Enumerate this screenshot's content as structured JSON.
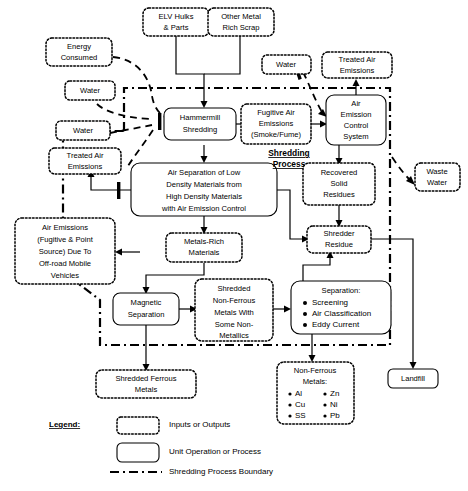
{
  "figure": {
    "boxes": [
      {
        "id": "elv_hulks",
        "kind": "input-output",
        "lines": [
          "ELV Hulks",
          "& Parts"
        ]
      },
      {
        "id": "other_metal_scrap",
        "kind": "input-output",
        "lines": [
          "Other Metal",
          "Rich Scrap"
        ]
      },
      {
        "id": "energy_consumed",
        "kind": "input-output",
        "lines": [
          "Energy",
          "Consumed"
        ]
      },
      {
        "id": "water_top",
        "kind": "input-output",
        "lines": [
          "Water"
        ]
      },
      {
        "id": "water_left",
        "kind": "input-output",
        "lines": [
          "Water"
        ]
      },
      {
        "id": "water_right",
        "kind": "input-output",
        "lines": [
          "Water"
        ]
      },
      {
        "id": "treated_air_emissions_left",
        "kind": "input-output",
        "lines": [
          "Treated Air",
          "Emissions"
        ]
      },
      {
        "id": "treated_air_emissions_right",
        "kind": "input-output",
        "lines": [
          "Treated Air",
          "Emissions"
        ]
      },
      {
        "id": "hammermill_shredding",
        "kind": "unit-operation",
        "lines": [
          "Hammermill",
          "Shredding"
        ]
      },
      {
        "id": "fugitive_air_emissions",
        "kind": "input-output",
        "lines": [
          "Fugitive Air",
          "Emissions",
          "(Smoke/Fume)"
        ]
      },
      {
        "id": "air_emission_control_system",
        "kind": "unit-operation",
        "lines": [
          "Air",
          "Emission",
          "Control",
          "System"
        ]
      },
      {
        "id": "air_separation",
        "kind": "unit-operation",
        "lines": [
          "Air Separation of Low",
          "Density Materials from",
          "High Density Materials",
          "with Air Emission Control"
        ]
      },
      {
        "id": "recovered_solid_residues",
        "kind": "input-output",
        "lines": [
          "Recovered",
          "Solid",
          "Residues"
        ]
      },
      {
        "id": "shredder_residue",
        "kind": "input-output",
        "lines": [
          "Shredder",
          "Residue"
        ]
      },
      {
        "id": "waste_water",
        "kind": "input-output",
        "lines": [
          "Waste",
          "Water"
        ]
      },
      {
        "id": "air_emissions_mobile",
        "kind": "input-output",
        "lines": [
          "Air Emissions",
          "(Fugitive & Point",
          "Source) Due To",
          "Off-road Mobile",
          "Vehicles"
        ]
      },
      {
        "id": "metals_rich_materials",
        "kind": "input-output",
        "lines": [
          "Metals-Rich",
          "Materials"
        ]
      },
      {
        "id": "magnetic_separation",
        "kind": "unit-operation",
        "lines": [
          "Magnetic",
          "Separation"
        ]
      },
      {
        "id": "shredded_non_ferrous",
        "kind": "input-output",
        "lines": [
          "Shredded",
          "Non-Ferrous",
          "Metals With",
          "Some Non-",
          "Metallics"
        ]
      },
      {
        "id": "separation",
        "kind": "unit-operation",
        "heading": "Separation:",
        "bullets": [
          "Screening",
          "Air Classification",
          "Eddy Current"
        ]
      },
      {
        "id": "shredded_ferrous_metals",
        "kind": "input-output",
        "lines": [
          "Shredded Ferrous",
          "Metals"
        ]
      },
      {
        "id": "non_ferrous_metals",
        "kind": "input-output",
        "heading_lines": [
          "Non-Ferrous",
          "Metals:"
        ],
        "items_left": [
          "Al",
          "Cu",
          "SS"
        ],
        "items_right": [
          "Zn",
          "Ni",
          "Pb"
        ]
      },
      {
        "id": "landfill",
        "kind": "unit-operation",
        "lines": [
          "Landfill"
        ]
      }
    ],
    "process_label": {
      "line1": "Shredding",
      "line2": "Process"
    },
    "legend": {
      "title": "Legend:",
      "entries": [
        {
          "swatch": "dotted-box",
          "label": "Inputs or Outputs"
        },
        {
          "swatch": "solid-rounded-box",
          "label": "Unit Operation or Process"
        },
        {
          "swatch": "dash-dot-line",
          "label": "Shredding Process Boundary"
        }
      ]
    },
    "colors": {
      "stroke": "#000000",
      "background": "#ffffff"
    }
  }
}
